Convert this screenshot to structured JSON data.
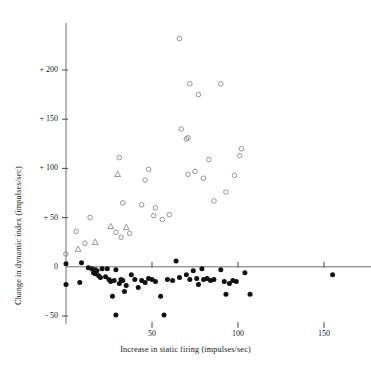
{
  "chart_data": {
    "type": "scatter",
    "title": "",
    "xlabel": "Increase in static firing (impulses/sec)",
    "ylabel": "Change in dynamic index (impulses/sec)",
    "xlim": [
      -4,
      178
    ],
    "ylim": [
      -62,
      248
    ],
    "xticks": [
      50,
      100,
      150
    ],
    "xtick_labels": [
      "50",
      "100",
      "150"
    ],
    "yticks": [
      -50,
      0,
      50,
      100,
      150,
      200
    ],
    "ytick_labels": [
      "- 50",
      "0",
      "+ 50",
      "+ 100",
      "+ 150",
      "+ 200"
    ],
    "grid": false,
    "legend": "none",
    "zero_line": 0,
    "series": [
      {
        "name": "open-circle",
        "marker": "open circle",
        "color": "#8a8a8a",
        "points": [
          [
            0,
            13
          ],
          [
            6,
            36
          ],
          [
            11,
            24
          ],
          [
            14,
            50
          ],
          [
            29,
            35
          ],
          [
            31,
            111
          ],
          [
            32,
            30
          ],
          [
            33,
            65
          ],
          [
            37,
            34
          ],
          [
            44,
            63
          ],
          [
            46,
            88
          ],
          [
            48,
            99
          ],
          [
            51,
            52
          ],
          [
            52,
            60
          ],
          [
            56,
            48
          ],
          [
            60,
            53
          ],
          [
            66,
            232
          ],
          [
            67,
            140
          ],
          [
            70,
            130
          ],
          [
            71,
            131
          ],
          [
            71,
            94
          ],
          [
            72,
            186
          ],
          [
            75,
            97
          ],
          [
            77,
            175
          ],
          [
            80,
            90
          ],
          [
            83,
            109
          ],
          [
            86,
            67
          ],
          [
            90,
            186
          ],
          [
            93,
            76
          ],
          [
            98,
            93
          ],
          [
            101,
            113
          ],
          [
            102,
            120
          ]
        ]
      },
      {
        "name": "open-triangle",
        "marker": "open triangle",
        "color": "#8a8a8a",
        "points": [
          [
            7,
            18
          ],
          [
            17,
            25
          ],
          [
            26,
            41
          ],
          [
            30,
            94
          ],
          [
            35,
            40
          ]
        ]
      },
      {
        "name": "filled-circle",
        "marker": "filled circle",
        "color": "#111111",
        "points": [
          [
            0,
            3
          ],
          [
            0,
            -18
          ],
          [
            8,
            -16
          ],
          [
            9,
            4
          ],
          [
            13,
            -1
          ],
          [
            15,
            -2
          ],
          [
            16,
            -6
          ],
          [
            17,
            -3
          ],
          [
            17,
            -7
          ],
          [
            18,
            -4
          ],
          [
            19,
            -9
          ],
          [
            20,
            -11
          ],
          [
            21,
            -2
          ],
          [
            23,
            -10
          ],
          [
            24,
            -2
          ],
          [
            25,
            -13
          ],
          [
            26,
            -15
          ],
          [
            27,
            -30
          ],
          [
            28,
            -14
          ],
          [
            29,
            -3
          ],
          [
            29,
            -49
          ],
          [
            31,
            -17
          ],
          [
            32,
            -13
          ],
          [
            33,
            -14
          ],
          [
            34,
            -25
          ],
          [
            35,
            -19
          ],
          [
            38,
            -8
          ],
          [
            40,
            -13
          ],
          [
            42,
            -21
          ],
          [
            44,
            -14
          ],
          [
            46,
            -16
          ],
          [
            48,
            -12
          ],
          [
            50,
            -13
          ],
          [
            52,
            -15
          ],
          [
            55,
            -30
          ],
          [
            57,
            -49
          ],
          [
            59,
            -13
          ],
          [
            62,
            -14
          ],
          [
            64,
            6
          ],
          [
            66,
            -11
          ],
          [
            70,
            -8
          ],
          [
            72,
            -13
          ],
          [
            74,
            -4
          ],
          [
            76,
            -12
          ],
          [
            77,
            -18
          ],
          [
            79,
            -2
          ],
          [
            80,
            -13
          ],
          [
            82,
            -12
          ],
          [
            84,
            -14
          ],
          [
            86,
            -13
          ],
          [
            90,
            -3
          ],
          [
            92,
            -15
          ],
          [
            93,
            -28
          ],
          [
            95,
            -17
          ],
          [
            97,
            -14
          ],
          [
            99,
            -15
          ],
          [
            104,
            -6
          ],
          [
            107,
            -28
          ],
          [
            155,
            -8
          ]
        ]
      }
    ]
  }
}
